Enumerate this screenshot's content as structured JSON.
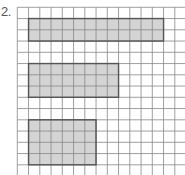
{
  "problem": {
    "number_label": "2."
  },
  "grid": {
    "columns_visible": 15,
    "rows_visible": 15,
    "line_color": "#888888",
    "background": "#ffffff"
  },
  "rectangles": [
    {
      "name": "rectangle-1",
      "col": 1,
      "row": 1,
      "width_units": 12,
      "height_units": 2,
      "area_units": 24
    },
    {
      "name": "rectangle-2",
      "col": 1,
      "row": 5,
      "width_units": 8,
      "height_units": 3,
      "area_units": 24
    },
    {
      "name": "rectangle-3",
      "col": 1,
      "row": 10,
      "width_units": 6,
      "height_units": 4,
      "area_units": 24
    }
  ],
  "colors": {
    "fill": "#d4d4d4",
    "outline": "#555555"
  }
}
